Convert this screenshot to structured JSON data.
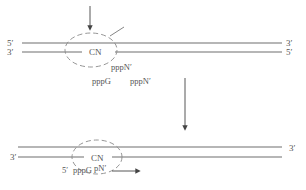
{
  "diagram": {
    "type": "transcription-initiation-schematic",
    "colors": {
      "strand": "#6e6e6e",
      "ellipse": "#8a8a8a",
      "text": "#555555",
      "arrow": "#444444"
    },
    "top_panel": {
      "strand_upper": {
        "left_label": "5′",
        "right_label": "3′"
      },
      "strand_lower": {
        "left_label": "3′",
        "right_label": "5′"
      },
      "complex_label": "CN",
      "nucleotides": {
        "near": "pppN′",
        "free_left": "pppG",
        "free_right": "pppN′"
      }
    },
    "transition_arrow": {
      "direction": "down"
    },
    "bottom_panel": {
      "strand_upper": {
        "right_label": "3′"
      },
      "strand_lower": {
        "left_label": "3′"
      },
      "complex_label": "CN",
      "product": {
        "prime": "5′",
        "text": "pppG",
        "text2": "pN′"
      }
    }
  }
}
